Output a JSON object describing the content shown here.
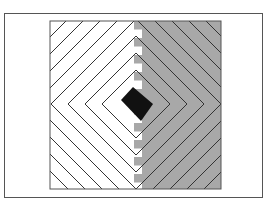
{
  "figure": {
    "type": "log-cabin quilt block diagram",
    "colors": {
      "background": "#ffffff",
      "frame": "#555555",
      "light_half": "#ffffff",
      "dark_half": "#a8a8a8",
      "center": "#111111",
      "strip_line": "#333333"
    },
    "block": {
      "x": 50,
      "y": 21,
      "width": 171,
      "height": 168
    },
    "center": {
      "cx": 136,
      "cy": 104,
      "half_diagonal": 17
    },
    "ring_spacing": 17,
    "ring_count": 8
  }
}
